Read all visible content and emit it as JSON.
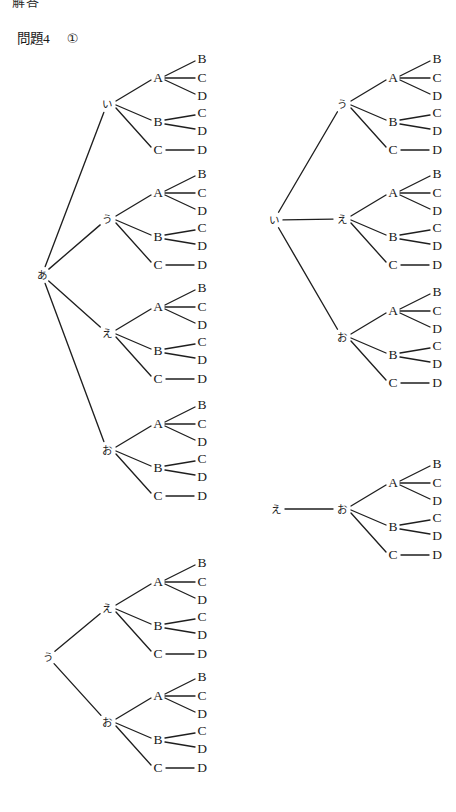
{
  "page": {
    "width": 456,
    "height": 812,
    "background": "#ffffff",
    "ink_color": "#1f1f1f",
    "cropped_header_text": "解答",
    "title": {
      "label": "問題4",
      "item_marker": "①"
    }
  },
  "labels": {
    "a": "あ",
    "i": "い",
    "u": "う",
    "e": "え",
    "o": "お",
    "A": "A",
    "B": "B",
    "C": "C",
    "D": "D"
  },
  "diagram": {
    "type": "tree-diagram",
    "subtree_pattern": {
      "branches": [
        {
          "node": "A",
          "children": [
            "B",
            "C",
            "D"
          ]
        },
        {
          "node": "B",
          "children": [
            "C",
            "D"
          ]
        },
        {
          "node": "C",
          "children": [
            "D"
          ]
        }
      ]
    },
    "groups": [
      {
        "id": "group-1",
        "name": "tree-a",
        "root": "あ",
        "root_pos": {
          "x": 42,
          "y": 275
        },
        "branches": [
          {
            "label": "い",
            "x": 107,
            "y": 104
          },
          {
            "label": "う",
            "x": 107,
            "y": 219
          },
          {
            "label": "え",
            "x": 107,
            "y": 333
          },
          {
            "label": "お",
            "x": 107,
            "y": 450
          }
        ]
      },
      {
        "id": "group-2",
        "name": "tree-i",
        "root": "い",
        "root_pos": {
          "x": 274,
          "y": 220
        },
        "branches": [
          {
            "label": "う",
            "x": 342,
            "y": 104
          },
          {
            "label": "え",
            "x": 342,
            "y": 219
          },
          {
            "label": "お",
            "x": 342,
            "y": 337
          }
        ]
      },
      {
        "id": "group-3",
        "name": "tree-e",
        "root": "え",
        "root_pos": {
          "x": 276,
          "y": 509
        },
        "branches": [
          {
            "label": "お",
            "x": 342,
            "y": 509
          }
        ]
      },
      {
        "id": "group-4",
        "name": "tree-u",
        "root": "う",
        "root_pos": {
          "x": 48,
          "y": 657
        },
        "branches": [
          {
            "label": "え",
            "x": 107,
            "y": 608
          },
          {
            "label": "お",
            "x": 107,
            "y": 722
          }
        ]
      }
    ],
    "subtree_offsets": {
      "mid_dx": 51,
      "leaf_dx": 95,
      "A_dy": -26,
      "B_dy": 18,
      "C_dy": 46,
      "A_leaf_dy": [
        -45,
        -26,
        -8
      ],
      "B_leaf_dy": [
        9,
        27
      ],
      "C_leaf_dy": [
        46
      ]
    }
  }
}
